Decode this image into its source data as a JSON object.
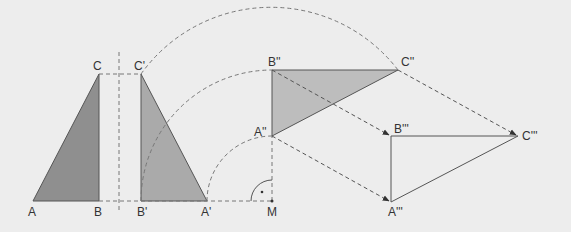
{
  "diagram": {
    "title": "",
    "colors": {
      "background": "#ededed",
      "triangle_dark": "#8f8f8f",
      "triangle_mid": "#aaaaaa",
      "triangle_light": "#bdbdbd",
      "line": "#555555",
      "dashed": "#777777"
    },
    "labels": {
      "A": "A",
      "B": "B",
      "C": "C",
      "A1": "A'",
      "B1": "B'",
      "C1": "C'",
      "A2": "A''",
      "B2": "B''",
      "C2": "C''",
      "A3": "A'''",
      "B3": "B'''",
      "C3": "C'''",
      "M": "M"
    }
  }
}
